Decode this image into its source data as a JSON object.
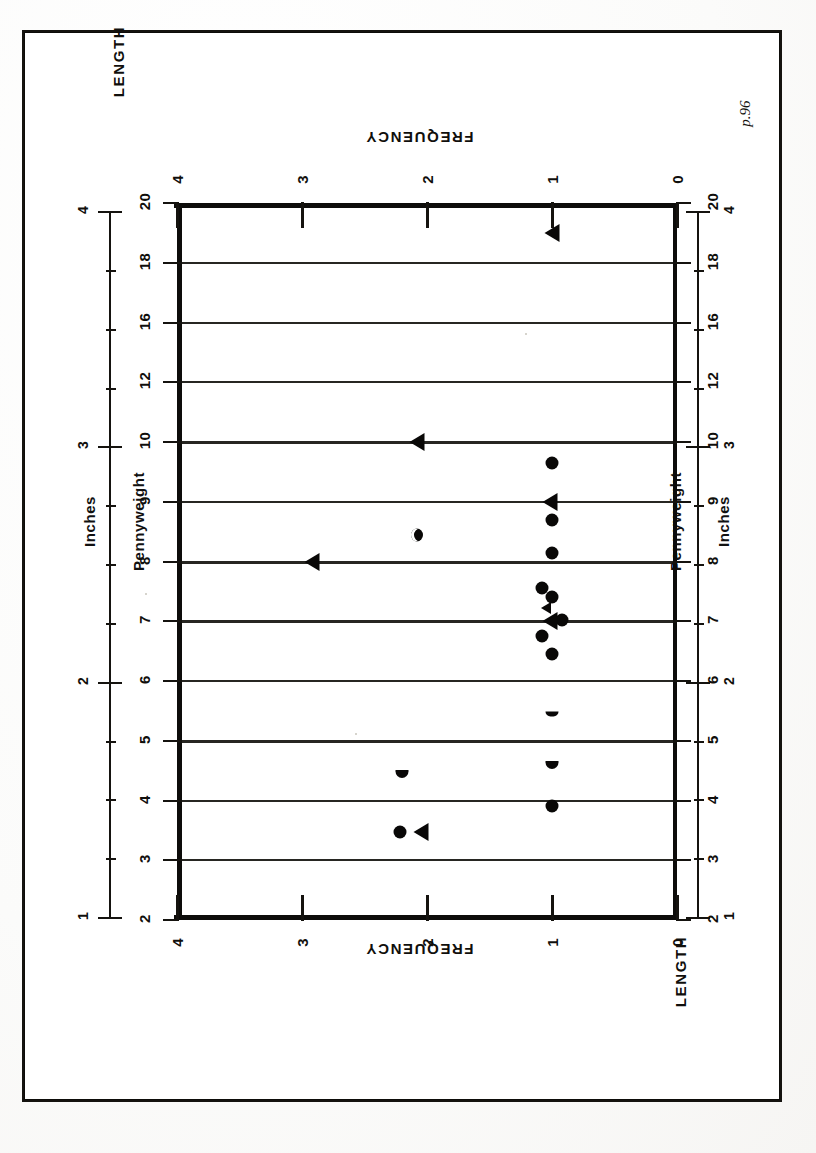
{
  "figure": {
    "caption": "Figure 110.  Distribution of Metal Items Quantifiable by Pennyweight.",
    "hand_annotation": "p.96"
  },
  "axis_titles": {
    "frequency_top": "FREQUENCY",
    "frequency_bottom": "FREQUENCY",
    "length_top": "LENGTH",
    "length_bottom": "LENGTH",
    "pennyweight_left": "Pennyweight",
    "pennyweight_right": "Pennyweight",
    "inches_left": "Inches",
    "inches_right": "Inches"
  },
  "chart_data": {
    "type": "scatter",
    "title": "Distribution of Metal Items Quantifiable by Pennyweight",
    "orientation": "rotated-90-scanned-page",
    "xlabel": "FREQUENCY",
    "ylabel": "Pennyweight",
    "secondary_axis_label": "LENGTH (Inches)",
    "grid": true,
    "legend_position": "none",
    "xlim": [
      0,
      4
    ],
    "xticks": [
      0,
      1,
      2,
      3,
      4
    ],
    "xticklabels": [
      "0",
      "1",
      "2",
      "3",
      "4"
    ],
    "y_axis_name": "Pennyweight",
    "yticks": [
      2,
      3,
      4,
      5,
      6,
      7,
      8,
      9,
      10,
      12,
      16,
      18,
      20
    ],
    "yticklabels": [
      "2",
      "3",
      "4",
      "5",
      "6",
      "7",
      "8",
      "9",
      "10",
      "12",
      "16",
      "18",
      "20"
    ],
    "inches_ruler": {
      "label": "Inches",
      "major_ticks": [
        1,
        2,
        3,
        4
      ],
      "majorticklabels": [
        "1",
        "2",
        "3",
        "4"
      ],
      "minor_ticks_per_inch": 4
    },
    "series": [
      {
        "name": "Pennyweight (circle markers)",
        "marker": "circle",
        "points": [
          {
            "x": 1.0,
            "y": 9.65,
            "shape": "circle"
          },
          {
            "x": 1.0,
            "y": 8.7,
            "shape": "circle"
          },
          {
            "x": 1.0,
            "y": 8.15,
            "shape": "circle"
          },
          {
            "x": 1.08,
            "y": 7.55,
            "shape": "circle"
          },
          {
            "x": 1.0,
            "y": 7.4,
            "shape": "circle"
          },
          {
            "x": 0.92,
            "y": 7.02,
            "shape": "circle"
          },
          {
            "x": 1.08,
            "y": 6.75,
            "shape": "circle"
          },
          {
            "x": 1.0,
            "y": 6.45,
            "shape": "circle"
          },
          {
            "x": 1.0,
            "y": 5.45,
            "shape": "sliver"
          },
          {
            "x": 1.0,
            "y": 4.6,
            "shape": "half"
          },
          {
            "x": 1.0,
            "y": 3.9,
            "shape": "circle"
          },
          {
            "x": 2.22,
            "y": 3.48,
            "shape": "circle"
          },
          {
            "x": 2.2,
            "y": 4.45,
            "shape": "half"
          },
          {
            "x": 2.08,
            "y": 8.45,
            "shape": "hollow"
          }
        ]
      },
      {
        "name": "Length in Inches (triangle markers)",
        "marker": "left-triangle",
        "points": [
          {
            "x": 1.0,
            "y": 19.0,
            "shape": "triangle"
          },
          {
            "x": 2.08,
            "y": 10.0,
            "shape": "triangle"
          },
          {
            "x": 1.02,
            "y": 9.0,
            "shape": "triangle"
          },
          {
            "x": 2.92,
            "y": 8.0,
            "shape": "triangle"
          },
          {
            "x": 1.05,
            "y": 7.22,
            "shape": "triangle-small"
          },
          {
            "x": 1.02,
            "y": 7.0,
            "shape": "triangle"
          },
          {
            "x": 2.05,
            "y": 3.48,
            "shape": "triangle"
          }
        ]
      }
    ]
  }
}
